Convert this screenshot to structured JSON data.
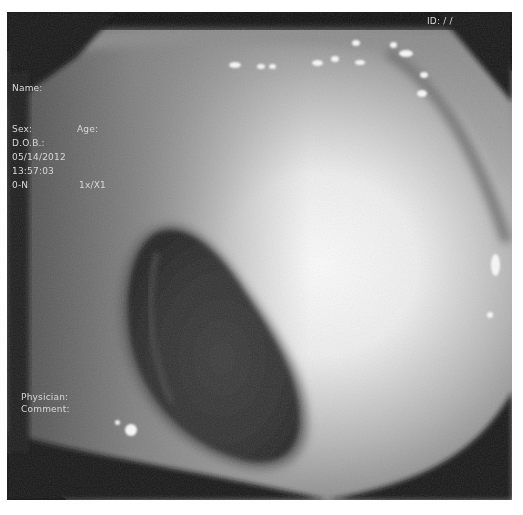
{
  "image": {
    "description": "Grayscale endoscopic view of colon lumen with patient info overlay",
    "colors": {
      "border": "#0f0f0f",
      "mucosa_dark": "#6a6a6a",
      "mucosa_mid": "#9a9a9a",
      "mucosa_bright": "#f2f2f2",
      "lumen": "#2e2e2e"
    }
  },
  "overlay": {
    "top_right": "ID: / /",
    "name_label": "Name:",
    "sex_label": "Sex:",
    "age_label": "Age:",
    "dob_label": "D.O.B.:",
    "date": "05/14/2012",
    "time": "13:57:03",
    "mode": "0-N",
    "zoom": "1x/X1",
    "physician_label": "Physician:",
    "comment_label": "Comment:"
  }
}
